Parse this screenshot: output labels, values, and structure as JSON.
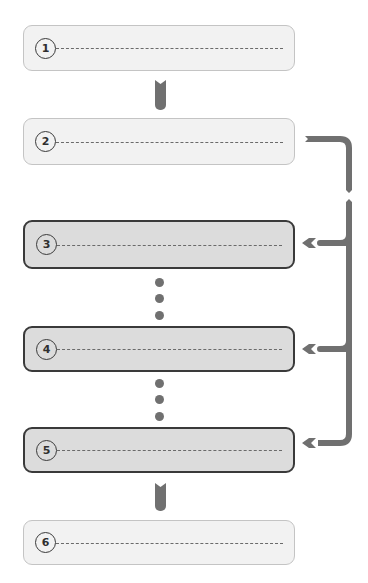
{
  "diagram": {
    "type": "flowchart",
    "steps": [
      {
        "number": "1",
        "style": "light",
        "text": ""
      },
      {
        "number": "2",
        "style": "light",
        "text": ""
      },
      {
        "number": "3",
        "style": "dark",
        "text": ""
      },
      {
        "number": "4",
        "style": "dark",
        "text": ""
      },
      {
        "number": "5",
        "style": "dark",
        "text": ""
      },
      {
        "number": "6",
        "style": "light",
        "text": ""
      }
    ],
    "connectors": [
      {
        "from": "1",
        "to": "2",
        "kind": "vertical-arrow"
      },
      {
        "from": "2",
        "to": "3",
        "kind": "bracket-branch"
      },
      {
        "from": "2",
        "to": "4",
        "kind": "bracket-branch"
      },
      {
        "from": "2",
        "to": "5",
        "kind": "bracket-branch"
      },
      {
        "from": "3",
        "to": "4",
        "kind": "ellipsis"
      },
      {
        "from": "4",
        "to": "5",
        "kind": "ellipsis"
      },
      {
        "from": "5",
        "to": "6",
        "kind": "vertical-arrow"
      }
    ],
    "colors": {
      "light_fill": "#f2f2f2",
      "light_border": "#c4c4c4",
      "dark_fill": "#dcdcdc",
      "dark_border": "#3a3a3a",
      "connector": "#707070"
    }
  }
}
